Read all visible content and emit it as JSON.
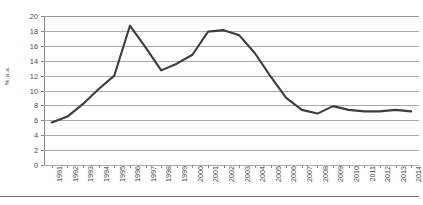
{
  "chart_data": {
    "type": "line",
    "title": "",
    "xlabel": "",
    "ylabel": "% a.a.",
    "ylim": [
      0,
      20
    ],
    "ytick_step": 2,
    "grid": true,
    "legend": "none",
    "line_color": "#3d3d3d",
    "grid_color": "#a9a9a9",
    "categories": [
      "1991",
      "1992",
      "1993",
      "1994",
      "1995",
      "1996",
      "1997",
      "1998",
      "1999",
      "2000",
      "2001",
      "2002",
      "2003",
      "2004",
      "2005",
      "2006",
      "2007",
      "2008",
      "2009",
      "2010",
      "2011",
      "2012",
      "2013",
      "2014"
    ],
    "yticks": [
      "0",
      "2",
      "4",
      "6",
      "8",
      "10",
      "12",
      "14",
      "16",
      "18",
      "20"
    ],
    "values": [
      5.7,
      6.5,
      8.2,
      10.2,
      12.0,
      18.7,
      15.8,
      12.7,
      13.6,
      14.8,
      17.9,
      18.1,
      17.4,
      15.0,
      11.9,
      9.0,
      7.4,
      6.9,
      7.9,
      7.4,
      7.2,
      7.2,
      7.4,
      7.2
    ],
    "series_name": "% a.a."
  }
}
